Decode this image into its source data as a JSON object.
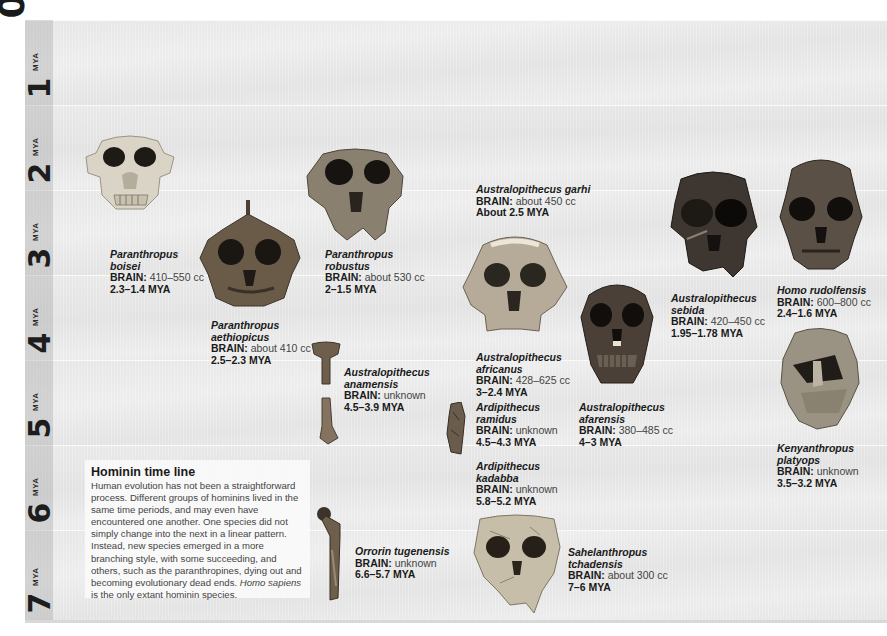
{
  "figure": {
    "title": "Hominin time line",
    "description_main": "Human evolution has not been a straightforward process. Different groups of hominins lived in the same time periods, and may even have encountered one another. One species did not simply change into the next in a linear pattern. Instead, new species emerged in a more branching style, with some succeeding, and others, such as the paranthropines, dying out and becoming evolutionary dead ends.",
    "description_italic": "Homo sapiens",
    "description_end": " is the only extant hominin species."
  },
  "axis": {
    "zero_label": "0",
    "unit": "MYA",
    "ticks": [
      {
        "value": "1",
        "unit": "MYA"
      },
      {
        "value": "2",
        "unit": "MYA"
      },
      {
        "value": "3",
        "unit": "MYA"
      },
      {
        "value": "4",
        "unit": "MYA"
      },
      {
        "value": "5",
        "unit": "MYA"
      },
      {
        "value": "6",
        "unit": "MYA"
      },
      {
        "value": "7",
        "unit": "MYA"
      }
    ]
  },
  "brain_label": "BRAIN:",
  "species": [
    {
      "name_line1": "Paranthropus",
      "name_line2": "boisei",
      "brain": "410–550 cc",
      "dates": "2.3–1.4 MYA",
      "fossil": "skull-pale"
    },
    {
      "name_line1": "Paranthropus",
      "name_line2": "aethiopicus",
      "brain": "about 410 cc",
      "dates": "2.5–2.3 MYA",
      "fossil": "skull-dark"
    },
    {
      "name_line1": "Paranthropus",
      "name_line2": "robustus",
      "brain": "about 530 cc",
      "dates": "2–1.5 MYA",
      "fossil": "skull-mid"
    },
    {
      "name_line1": "Australopithecus",
      "name_line2": "anamensis",
      "brain": "unknown",
      "dates": "4.5–3.9 MYA",
      "fossil": "leg-bone"
    },
    {
      "name_line1": "Australopithecus garhi",
      "name_line2": "",
      "brain": "about 450 cc",
      "dates": "About 2.5 MYA",
      "fossil": "none"
    },
    {
      "name_line1": "Australopithecus",
      "name_line2": "africanus",
      "brain": "428–625 cc",
      "dates": "3–2.4 MYA",
      "fossil": "skull-pale"
    },
    {
      "name_line1": "Ardipithecus",
      "name_line2": "ramidus",
      "brain": "unknown",
      "dates": "4.5–4.3 MYA",
      "fossil": "bone-fragment"
    },
    {
      "name_line1": "Ardipithecus",
      "name_line2": "kadabba",
      "brain": "unknown",
      "dates": "5.8–5.2 MYA",
      "fossil": "none"
    },
    {
      "name_line1": "Australopithecus",
      "name_line2": "afarensis",
      "brain": "380–485 cc",
      "dates": "4–3 MYA",
      "fossil": "skull-dark"
    },
    {
      "name_line1": "Australopithecus",
      "name_line2": "sebida",
      "brain": "420–450 cc",
      "dates": "1.95–1.78 MYA",
      "fossil": "skull-dark"
    },
    {
      "name_line1": "Homo rudolfensis",
      "name_line2": "",
      "brain": "600–800 cc",
      "dates": "2.4–1.6 MYA",
      "fossil": "skull-dark"
    },
    {
      "name_line1": "Kenyanthropus",
      "name_line2": "platyops",
      "brain": "unknown",
      "dates": "3.5–3.2 MYA",
      "fossil": "skull-mid"
    },
    {
      "name_line1": "Orrorin tugenensis",
      "name_line2": "",
      "brain": "unknown",
      "dates": "6.6–5.7 MYA",
      "fossil": "femur"
    },
    {
      "name_line1": "Sahelanthropus",
      "name_line2": "tchadensis",
      "brain": "about 300 cc",
      "dates": "7–6 MYA",
      "fossil": "skull-pale"
    }
  ],
  "colors": {
    "band": "#e6e6e6",
    "axis_strip": "#c8c8c8",
    "text": "#1a1a1a",
    "info_box": "#fafafa"
  }
}
